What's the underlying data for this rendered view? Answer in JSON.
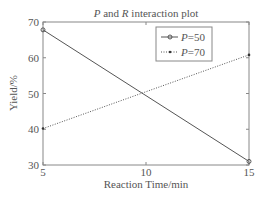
{
  "chart_data": {
    "type": "line",
    "title": "P and R interaction plot",
    "title_parts": [
      {
        "text": "P",
        "italic": true
      },
      {
        "text": " and ",
        "italic": false
      },
      {
        "text": "R",
        "italic": true
      },
      {
        "text": " interaction plot",
        "italic": false
      }
    ],
    "xlabel": "Reaction Time/min",
    "ylabel": "Yield/%",
    "x": [
      5,
      15
    ],
    "xticks": [
      5,
      10,
      15
    ],
    "yticks": [
      30,
      40,
      50,
      60,
      70
    ],
    "xlim": [
      5,
      15
    ],
    "ylim": [
      30,
      70
    ],
    "grid": false,
    "legend_position": "upper right (inside)",
    "series": [
      {
        "name": "P=50",
        "label_var": "P",
        "label_val": "=50",
        "values": [
          67.8,
          31.0
        ],
        "line_style": "solid",
        "marker": "circle",
        "color": "#555555"
      },
      {
        "name": "P=70",
        "label_var": "P",
        "label_val": "=70",
        "values": [
          40.2,
          60.8
        ],
        "line_style": "dotted",
        "marker": "dot",
        "color": "#555555"
      }
    ]
  }
}
